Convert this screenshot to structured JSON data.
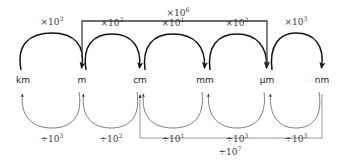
{
  "diagram": {
    "type": "unit-conversion-flow",
    "nodes": [
      {
        "id": "km",
        "label": "km",
        "x": 23
      },
      {
        "id": "m",
        "label": "m",
        "x": 82
      },
      {
        "id": "cm",
        "label": "cm",
        "x": 140
      },
      {
        "id": "mm",
        "label": "mm",
        "x": 205
      },
      {
        "id": "um",
        "label": "µm",
        "x": 267
      },
      {
        "id": "nm",
        "label": "nm",
        "x": 322
      }
    ],
    "node_row_y": 80,
    "multiply_arcs": [
      {
        "from": "km",
        "to": "m",
        "op": "×10",
        "exp": "3",
        "label": "×10³",
        "label_x": 52,
        "label_y": 37
      },
      {
        "from": "m",
        "to": "cm",
        "op": "×10",
        "exp": "2",
        "label": "×10²",
        "label_x": 111,
        "label_y": 37
      },
      {
        "from": "cm",
        "to": "mm",
        "op": "×10",
        "exp": "1",
        "label": "×10¹",
        "label_x": 172,
        "label_y": 37
      },
      {
        "from": "mm",
        "to": "um",
        "op": "×10",
        "exp": "3",
        "label": "×10³",
        "label_x": 236,
        "label_y": 37
      },
      {
        "from": "um",
        "to": "nm",
        "op": "×10",
        "exp": "3",
        "label": "×10³",
        "label_x": 295,
        "label_y": 37
      }
    ],
    "divide_arcs": [
      {
        "from": "m",
        "to": "km",
        "op": "÷10",
        "exp": "3",
        "label": "÷10³",
        "label_x": 52,
        "label_y": 124
      },
      {
        "from": "cm",
        "to": "m",
        "op": "÷10",
        "exp": "2",
        "label": "÷10²",
        "label_x": 111,
        "label_y": 124
      },
      {
        "from": "mm",
        "to": "cm",
        "op": "÷10",
        "exp": "1",
        "label": "÷10¹",
        "label_x": 172,
        "label_y": 124
      },
      {
        "from": "um",
        "to": "mm",
        "op": "÷10",
        "exp": "3",
        "label": "÷10³",
        "label_x": 236,
        "label_y": 124
      },
      {
        "from": "nm",
        "to": "um",
        "op": "÷10",
        "exp": "3",
        "label": "÷10³",
        "label_x": 295,
        "label_y": 124
      }
    ],
    "long_brackets": [
      {
        "id": "m-to-um",
        "from": "m",
        "to": "um",
        "direction": "multiply",
        "op": "×10",
        "exp": "6",
        "label": "×10⁶",
        "label_x": 178,
        "label_y": 13
      },
      {
        "id": "nm-to-cm",
        "from": "nm",
        "to": "cm",
        "direction": "divide",
        "op": "÷10",
        "exp": "7",
        "label": "÷10⁷",
        "label_x": 230,
        "label_y": 150
      }
    ]
  }
}
